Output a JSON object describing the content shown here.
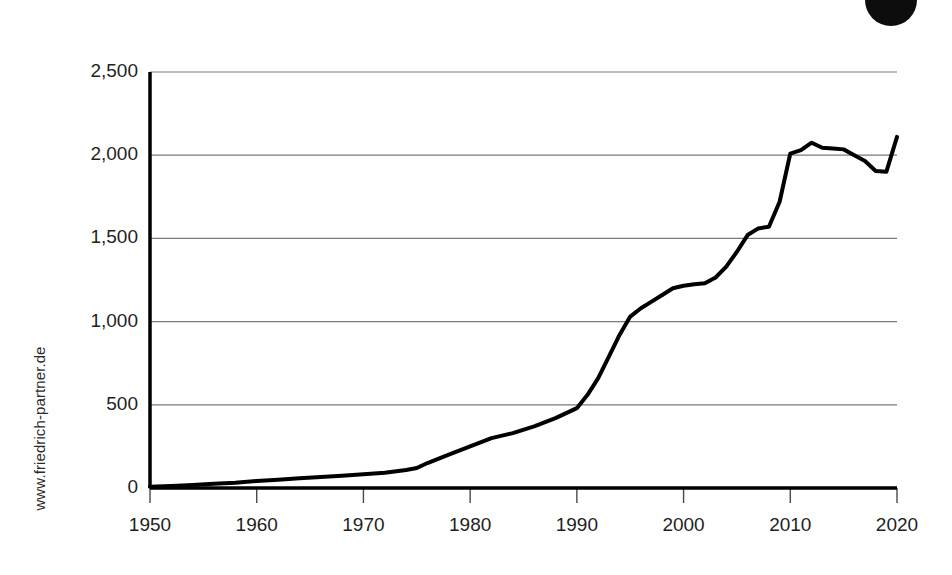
{
  "branding": {
    "watermark": "www.friedrich-partner.de",
    "logo_icon": "circle-logo-icon",
    "logo_color": "#0d0d0d"
  },
  "chart_data": {
    "type": "line",
    "title": "",
    "subtitle": "",
    "xlabel": "",
    "ylabel": "",
    "xlim": [
      1950,
      2020
    ],
    "ylim": [
      0,
      2500
    ],
    "grid": "horizontal",
    "legend": "none",
    "line_color": "#000000",
    "line_width": 4,
    "xticks": [
      1950,
      1960,
      1970,
      1980,
      1990,
      2000,
      2010,
      2020
    ],
    "xtick_labels": [
      "1950",
      "1960",
      "1970",
      "1980",
      "1990",
      "2000",
      "2010",
      "2020"
    ],
    "yticks": [
      0,
      500,
      1000,
      1500,
      2000,
      2500
    ],
    "ytick_labels": [
      "0",
      "500",
      "1,000",
      "1,500",
      "2,000",
      "2,500"
    ],
    "series": [
      {
        "name": "value",
        "x": [
          1950,
          1952,
          1954,
          1956,
          1958,
          1960,
          1962,
          1964,
          1966,
          1968,
          1970,
          1972,
          1974,
          1975,
          1976,
          1978,
          1980,
          1982,
          1984,
          1986,
          1988,
          1990,
          1991,
          1992,
          1993,
          1994,
          1995,
          1996,
          1997,
          1998,
          1999,
          2000,
          2001,
          2002,
          2003,
          2004,
          2005,
          2006,
          2007,
          2008,
          2009,
          2010,
          2011,
          2012,
          2013,
          2014,
          2015,
          2016,
          2017,
          2018,
          2019,
          2020
        ],
        "values": [
          8,
          12,
          18,
          25,
          32,
          42,
          50,
          58,
          66,
          74,
          82,
          92,
          108,
          120,
          150,
          200,
          250,
          300,
          330,
          370,
          420,
          480,
          560,
          660,
          790,
          920,
          1030,
          1080,
          1120,
          1160,
          1200,
          1215,
          1225,
          1230,
          1265,
          1330,
          1420,
          1520,
          1560,
          1570,
          1720,
          2010,
          2030,
          2075,
          2045,
          2040,
          2035,
          2000,
          1965,
          1905,
          1900,
          2110
        ]
      }
    ]
  },
  "axes_geometry": {
    "plot_left": 150,
    "plot_right": 897,
    "plot_top": 72,
    "plot_bottom": 488
  }
}
